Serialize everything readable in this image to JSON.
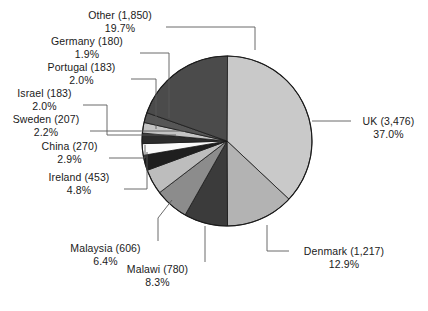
{
  "chart_data": {
    "type": "pie",
    "title": "",
    "subtitle": "",
    "xlabel": "",
    "ylabel": "",
    "legend_position": "callout-labels",
    "grid": false,
    "start_angle_deg": 0,
    "direction": "clockwise",
    "total": 9405,
    "categories": [
      "UK",
      "Denmark",
      "Malawi",
      "Malaysia",
      "Ireland",
      "China",
      "Sweden",
      "Israel",
      "Portugal",
      "Germany",
      "Other"
    ],
    "values": [
      3476,
      1217,
      780,
      606,
      453,
      270,
      207,
      183,
      183,
      180,
      1850
    ],
    "percentages": [
      37.0,
      12.9,
      8.3,
      6.4,
      4.8,
      2.9,
      2.2,
      2.0,
      2.0,
      1.9,
      19.7
    ],
    "slices": [
      {
        "name": "UK",
        "value": 3476,
        "value_text": "3,476",
        "label": "UK (3,476)",
        "pct": 37.0,
        "pct_text": "37.0%",
        "color": "#c9c9c9"
      },
      {
        "name": "Denmark",
        "value": 1217,
        "value_text": "1,217",
        "label": "Denmark (1,217)",
        "pct": 12.9,
        "pct_text": "12.9%",
        "color": "#b3b3b3"
      },
      {
        "name": "Malawi",
        "value": 780,
        "value_text": "780",
        "label": "Malawi (780)",
        "pct": 8.3,
        "pct_text": "8.3%",
        "color": "#3b3b3b"
      },
      {
        "name": "Malaysia",
        "value": 606,
        "value_text": "606",
        "label": "Malaysia (606)",
        "pct": 6.4,
        "pct_text": "6.4%",
        "color": "#8c8c8c"
      },
      {
        "name": "Ireland",
        "value": 453,
        "value_text": "453",
        "label": "Ireland (453)",
        "pct": 4.8,
        "pct_text": "4.8%",
        "color": "#bdbdbd"
      },
      {
        "name": "China",
        "value": 270,
        "value_text": "270",
        "label": "China (270)",
        "pct": 2.9,
        "pct_text": "2.9%",
        "color": "#1f1f1f"
      },
      {
        "name": "Sweden",
        "value": 207,
        "value_text": "207",
        "label": "Sweden (207)",
        "pct": 2.2,
        "pct_text": "2.2%",
        "color": "#fafafa"
      },
      {
        "name": "Israel",
        "value": 183,
        "value_text": "183",
        "label": "Israel (183)",
        "pct": 2.0,
        "pct_text": "2.0%",
        "color": "#2b2b2b"
      },
      {
        "name": "Portugal",
        "value": 183,
        "value_text": "183",
        "label": "Portugal (183)",
        "pct": 2.0,
        "pct_text": "2.0%",
        "color": "#c4c4c4"
      },
      {
        "name": "Germany",
        "value": 180,
        "value_text": "180",
        "label": "Germany (180)",
        "pct": 1.9,
        "pct_text": "1.9%",
        "color": "#565656"
      },
      {
        "name": "Other",
        "value": 1850,
        "value_text": "1,850",
        "label": "Other (1,850)",
        "pct": 19.7,
        "pct_text": "19.7%",
        "color": "#4b4b4b"
      }
    ]
  },
  "geometry": {
    "center_x": 227,
    "center_y": 141,
    "radius": 85,
    "outline_color": "#1a1a1a",
    "leader_color": "#5a5a5a",
    "background": "#ffffff"
  }
}
